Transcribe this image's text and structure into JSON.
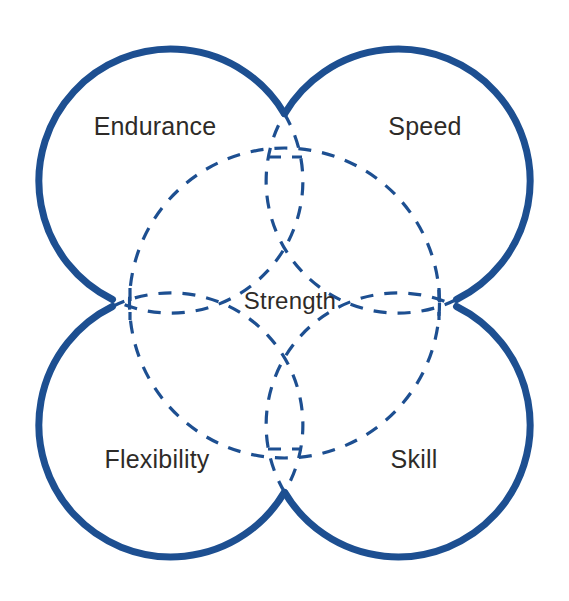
{
  "diagram": {
    "type": "venn-four-circle",
    "background_color": "#ffffff",
    "stroke_color": "#1d4f91",
    "text_color": "#2e2b28",
    "solid_stroke_width": 7,
    "dashed_stroke_width": 3.2,
    "dash_pattern": "13 11",
    "labels": {
      "top_left": "Endurance",
      "top_right": "Speed",
      "bottom_left": "Flexibility",
      "bottom_right": "Skill",
      "center": "Strength"
    },
    "geometry": {
      "canvas_width": 569,
      "canvas_height": 601,
      "center_x": 284.5,
      "center_y": 303,
      "circle_radius": 132,
      "offset": 119,
      "inner_circle_radius": 155,
      "circles": [
        {
          "name": "endurance-circle",
          "cx": 165.5,
          "cy": 184,
          "r": 132
        },
        {
          "name": "speed-circle",
          "cx": 403.5,
          "cy": 184,
          "r": 132
        },
        {
          "name": "flexibility-circle",
          "cx": 165.5,
          "cy": 422,
          "r": 132
        },
        {
          "name": "skill-circle",
          "cx": 403.5,
          "cy": 422,
          "r": 132
        }
      ],
      "label_positions": {
        "top_left": {
          "x": 155,
          "y": 126
        },
        "top_right": {
          "x": 425,
          "y": 126
        },
        "bottom_left": {
          "x": 157,
          "y": 459
        },
        "bottom_right": {
          "x": 414,
          "y": 459
        },
        "center": {
          "x": 290,
          "y": 301
        }
      }
    }
  }
}
